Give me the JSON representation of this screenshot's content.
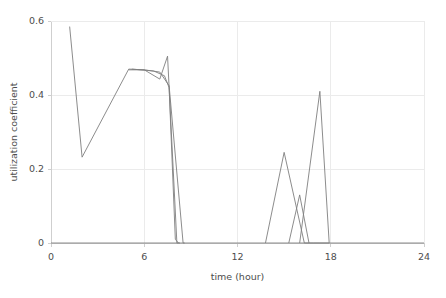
{
  "chart_data": {
    "type": "line",
    "title": "",
    "xlabel": "time (hour)",
    "ylabel": "utilization coefficient",
    "xlim": [
      0,
      24
    ],
    "ylim": [
      0,
      0.6
    ],
    "xticks": [
      0,
      6,
      12,
      18,
      24
    ],
    "xtick_labels": [
      "0",
      "6",
      "12",
      "18",
      "24"
    ],
    "yticks": [
      0,
      0.2,
      0.4,
      0.6
    ],
    "ytick_labels": [
      "0",
      "0.2",
      "0.4",
      "0.6"
    ],
    "grid": true,
    "grid_axis": "y",
    "legend": false,
    "legend_position": "none",
    "line_color": "#7f7f7f",
    "series": [
      {
        "name": "series-1",
        "x": [
          1.2,
          2.0,
          5.0,
          6.0,
          7.0,
          7.6,
          8.5,
          8.6
        ],
        "values": [
          0.585,
          0.232,
          0.47,
          0.468,
          0.462,
          0.425,
          0.0,
          0.0
        ]
      },
      {
        "name": "series-2",
        "x": [
          5.0,
          6.0,
          7.0,
          7.5,
          8.1,
          8.3
        ],
        "values": [
          0.468,
          0.468,
          0.443,
          0.505,
          0.0,
          0.0
        ]
      },
      {
        "name": "series-3",
        "x": [
          5.2,
          6.6,
          7.3,
          7.6,
          8.0,
          8.2
        ],
        "values": [
          0.47,
          0.465,
          0.452,
          0.42,
          0.01,
          0.0
        ]
      },
      {
        "name": "series-4",
        "x": [
          13.8,
          15.0,
          16.3,
          16.9,
          17.3,
          17.9
        ],
        "values": [
          0.0,
          0.245,
          0.0,
          0.0,
          0.0,
          0.0
        ]
      },
      {
        "name": "series-5",
        "x": [
          15.3,
          16.0,
          16.6
        ],
        "values": [
          0.0,
          0.13,
          0.0
        ]
      },
      {
        "name": "series-6",
        "x": [
          16.0,
          17.3,
          17.9
        ],
        "values": [
          0.0,
          0.41,
          0.0
        ]
      },
      {
        "name": "baseline",
        "x": [
          0.0,
          24.0
        ],
        "values": [
          0.0,
          0.0
        ]
      }
    ]
  },
  "axes": {
    "y_axis_label": "utilization coefficient",
    "x_axis_label": "time (hour)"
  }
}
